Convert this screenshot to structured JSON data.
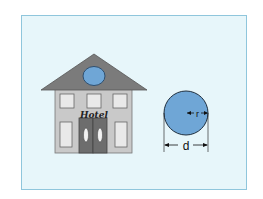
{
  "diagram": {
    "hotel": {
      "sign_text": "Hotel",
      "colors": {
        "roof": "#7b7b7b",
        "wall": "#c9c9c9",
        "window": "#e9e9e9",
        "door": "#6d6d6d",
        "roof_window": "#6fa6d6"
      }
    },
    "circle": {
      "radius_label": "r",
      "diameter_label": "d",
      "fill": "#6fa6d6"
    },
    "colors": {
      "frame_border": "#8fc6dc",
      "frame_background": "#e7f6fa"
    }
  }
}
